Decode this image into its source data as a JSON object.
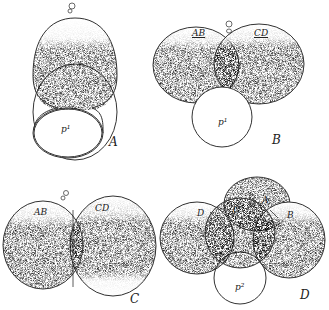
{
  "figure": {
    "panels": [
      {
        "id": "A",
        "label": "A",
        "cells": [
          "p1"
        ],
        "cell_labels": {
          "p1": "p¹"
        }
      },
      {
        "id": "B",
        "label": "B",
        "cells": [
          "AB",
          "CD",
          "p1"
        ],
        "cell_labels": {
          "AB": "AB",
          "CD": "CD",
          "p1": "p¹"
        }
      },
      {
        "id": "C",
        "label": "C",
        "cells": [
          "AB",
          "CD"
        ],
        "cell_labels": {
          "AB": "AB",
          "CD": "CD"
        }
      },
      {
        "id": "D",
        "label": "D",
        "cells": [
          "A",
          "B",
          "C",
          "D",
          "p2"
        ],
        "cell_labels": {
          "A": "A",
          "B": "B",
          "C": "C",
          "D": "D",
          "p2": "p²"
        }
      }
    ],
    "colors": {
      "stipple": "#555555",
      "outline": "#333333",
      "background": "#ffffff"
    }
  }
}
